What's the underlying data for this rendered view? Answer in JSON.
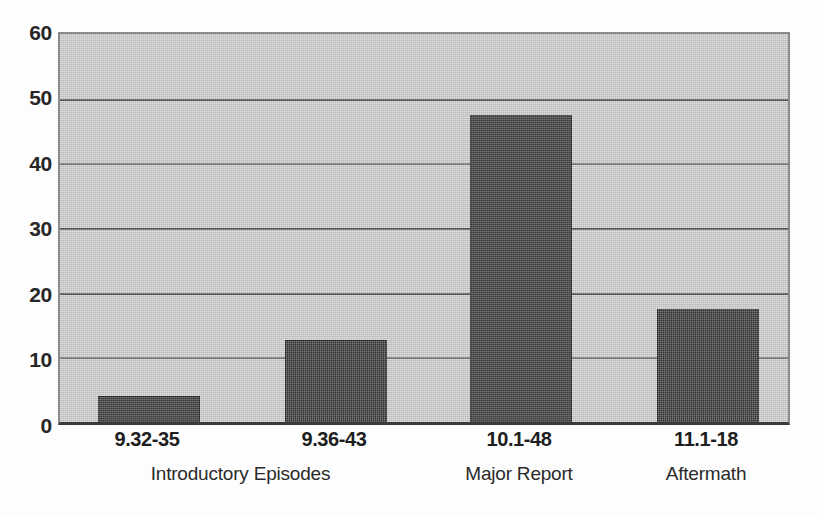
{
  "chart_data": {
    "type": "bar",
    "title": "",
    "subtitle": "",
    "xlabel": "",
    "ylabel": "",
    "categories": [
      "9.32-35",
      "9.36-43",
      "10.1-48",
      "11.1-18"
    ],
    "values": [
      4.0,
      12.7,
      47.5,
      17.5
    ],
    "group_labels": [
      "Introductory Episodes",
      "Major Report",
      "Aftermath"
    ],
    "group_spans": [
      2,
      1,
      1
    ],
    "ylim": [
      0,
      60
    ],
    "yticks": [
      0,
      10,
      20,
      30,
      40,
      50,
      60
    ],
    "ytick_labels": [
      "0",
      "10",
      "20",
      "30",
      "40",
      "50",
      "60"
    ],
    "grid": true,
    "grid_axis": "y",
    "legend": false,
    "legend_position": "none",
    "bars": [
      {
        "category": "9.32-35",
        "value": 4.0,
        "group": "Introductory Episodes"
      },
      {
        "category": "9.36-43",
        "value": 12.7,
        "group": "Introductory Episodes"
      },
      {
        "category": "10.1-48",
        "value": 47.5,
        "group": "Major Report"
      },
      {
        "category": "11.1-18",
        "value": 17.5,
        "group": "Aftermath"
      }
    ],
    "colors": {
      "bar_fill": "#303030",
      "plot_background": "#cbcbcb",
      "gridline": "#4a4a4a",
      "axis_line": "#3a3a3a",
      "text": "#1e1e1e",
      "figure_background": "#fdfdfd"
    }
  }
}
